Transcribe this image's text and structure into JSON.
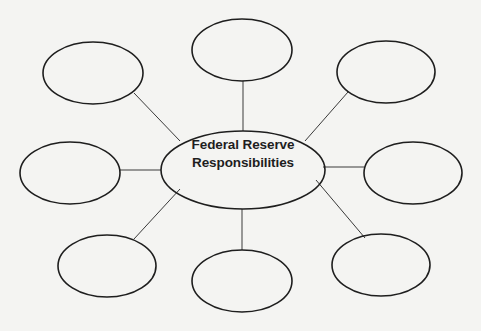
{
  "diagram": {
    "type": "concept-web",
    "center": {
      "line1": "Federal Reserve",
      "line2": "Responsibilities"
    },
    "outer_nodes": [
      {
        "id": "top-left",
        "label": ""
      },
      {
        "id": "top",
        "label": ""
      },
      {
        "id": "top-right",
        "label": ""
      },
      {
        "id": "left",
        "label": ""
      },
      {
        "id": "right",
        "label": ""
      },
      {
        "id": "bottom-left",
        "label": ""
      },
      {
        "id": "bottom",
        "label": ""
      },
      {
        "id": "bottom-right",
        "label": ""
      }
    ],
    "colors": {
      "background": "#f4f4f2",
      "stroke": "#1e1e1e",
      "connector": "#3a3a3a"
    }
  }
}
